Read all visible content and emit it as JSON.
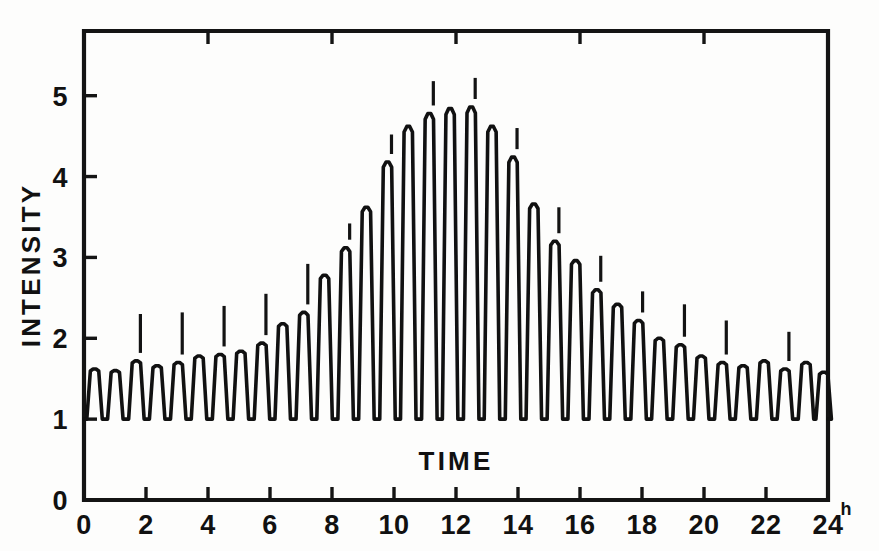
{
  "figure": {
    "background_color": "#fdfdfc",
    "ink_color": "#111111"
  },
  "labels": {
    "y_axis_title": "INTENSITY",
    "x_axis_title": "TIME",
    "x_unit": "h"
  },
  "chart_data": {
    "type": "line",
    "title": "",
    "subtitle": "",
    "xlabel": "TIME",
    "ylabel": "INTENSITY",
    "xlim": [
      0,
      24
    ],
    "ylim": [
      0,
      5.8
    ],
    "grid": false,
    "legend": null,
    "x_ticks": [
      0,
      2,
      4,
      6,
      8,
      10,
      12,
      14,
      16,
      18,
      20,
      22,
      24
    ],
    "x_tick_labels": [
      "0",
      "2",
      "4",
      "6",
      "8",
      "10",
      "12",
      "14",
      "16",
      "18",
      "20",
      "22",
      "24"
    ],
    "y_ticks": [
      0,
      1,
      2,
      3,
      4,
      5
    ],
    "y_tick_labels": [
      "0",
      "1",
      "2",
      "3",
      "4",
      "5"
    ],
    "x_unit_suffix": "h",
    "oscillation_period_hours": 0.675,
    "baseline_value": 1.0,
    "peaks": [
      {
        "x": 0.34,
        "y": 1.62
      },
      {
        "x": 1.01,
        "y": 1.6
      },
      {
        "x": 1.69,
        "y": 1.72
      },
      {
        "x": 2.36,
        "y": 1.66
      },
      {
        "x": 3.04,
        "y": 1.7
      },
      {
        "x": 3.71,
        "y": 1.78
      },
      {
        "x": 4.39,
        "y": 1.8
      },
      {
        "x": 5.06,
        "y": 1.84
      },
      {
        "x": 5.74,
        "y": 1.94
      },
      {
        "x": 6.41,
        "y": 2.18
      },
      {
        "x": 7.09,
        "y": 2.32
      },
      {
        "x": 7.76,
        "y": 2.78
      },
      {
        "x": 8.44,
        "y": 3.12
      },
      {
        "x": 9.11,
        "y": 3.62
      },
      {
        "x": 9.79,
        "y": 4.18
      },
      {
        "x": 10.46,
        "y": 4.62
      },
      {
        "x": 11.14,
        "y": 4.78
      },
      {
        "x": 11.81,
        "y": 4.84
      },
      {
        "x": 12.49,
        "y": 4.86
      },
      {
        "x": 13.16,
        "y": 4.62
      },
      {
        "x": 13.84,
        "y": 4.24
      },
      {
        "x": 14.51,
        "y": 3.66
      },
      {
        "x": 15.19,
        "y": 3.2
      },
      {
        "x": 15.86,
        "y": 2.96
      },
      {
        "x": 16.54,
        "y": 2.6
      },
      {
        "x": 17.21,
        "y": 2.42
      },
      {
        "x": 17.89,
        "y": 2.22
      },
      {
        "x": 18.56,
        "y": 2.0
      },
      {
        "x": 19.24,
        "y": 1.92
      },
      {
        "x": 19.91,
        "y": 1.78
      },
      {
        "x": 20.59,
        "y": 1.7
      },
      {
        "x": 21.26,
        "y": 1.66
      },
      {
        "x": 21.94,
        "y": 1.72
      },
      {
        "x": 22.61,
        "y": 1.62
      },
      {
        "x": 23.29,
        "y": 1.7
      },
      {
        "x": 23.86,
        "y": 1.58
      }
    ],
    "annotation_markers": [
      {
        "x": 1.69,
        "y_top": 2.3
      },
      {
        "x": 3.04,
        "y_top": 2.32
      },
      {
        "x": 4.39,
        "y_top": 2.4
      },
      {
        "x": 5.74,
        "y_top": 2.55
      },
      {
        "x": 7.09,
        "y_top": 2.92
      },
      {
        "x": 8.44,
        "y_top": 3.42
      },
      {
        "x": 9.79,
        "y_top": 4.52
      },
      {
        "x": 11.14,
        "y_top": 5.18
      },
      {
        "x": 12.49,
        "y_top": 5.22
      },
      {
        "x": 13.84,
        "y_top": 4.6
      },
      {
        "x": 15.19,
        "y_top": 3.62
      },
      {
        "x": 16.54,
        "y_top": 3.02
      },
      {
        "x": 17.89,
        "y_top": 2.58
      },
      {
        "x": 19.24,
        "y_top": 2.42
      },
      {
        "x": 20.59,
        "y_top": 2.22
      },
      {
        "x": 22.61,
        "y_top": 2.08
      }
    ]
  }
}
